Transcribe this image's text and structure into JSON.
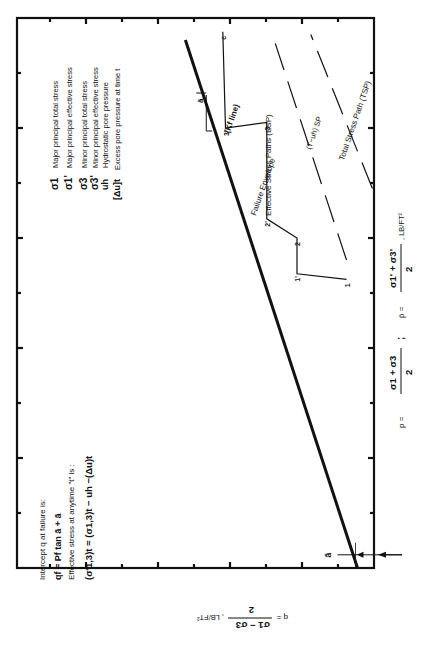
{
  "chart_data": {
    "type": "line",
    "orientation": "rotated 90° clockwise (p axis runs along page height, q axis along page width)",
    "xlabel": "p = (σ1 + σ3)/2 ;  p̄ = (σ1' + σ3')/2 , LB/FT²",
    "ylabel": "q = (σ1 − σ3)/2 , LB/FT²",
    "x_unit": "LB/FT²",
    "y_unit": "LB/FT²",
    "xlim": [
      0,
      100
    ],
    "ylim": [
      0,
      65
    ],
    "grid": false,
    "x_ticks": [
      10,
      20,
      30,
      40,
      50,
      60,
      70,
      80,
      90,
      100
    ],
    "y_ticks": [
      10,
      20,
      30,
      40,
      50,
      60
    ],
    "x_tick_labels": [],
    "y_tick_labels": [],
    "series": [
      {
        "name": "Failure Envelope (Kf line)",
        "style": "thick-solid",
        "points": [
          [
            0,
            3
          ],
          [
            96,
            34.3
          ]
        ]
      },
      {
        "name": "Effective Stress Paths (ESP)",
        "style": "thin-solid",
        "points": [
          [
            52.5,
            5
          ],
          [
            53.5,
            14
          ],
          [
            60,
            14
          ],
          [
            63.5,
            19.5
          ],
          [
            81,
            19.5
          ],
          [
            80,
            27
          ],
          [
            97.5,
            27.5
          ]
        ],
        "point_labels": [
          {
            "label": "1",
            "at": [
              52.5,
              5
            ]
          },
          {
            "label": "1'",
            "at": [
              53.5,
              14
            ]
          },
          {
            "label": "2",
            "at": [
              60,
              14
            ]
          },
          {
            "label": "2'",
            "at": [
              63.5,
              19.5
            ]
          },
          {
            "label": "3",
            "at": [
              81,
              19.5
            ]
          },
          {
            "label": "3'",
            "at": [
              80,
              27
            ]
          },
          {
            "label": "c",
            "at": [
              97.5,
              27.5
            ]
          }
        ]
      },
      {
        "name": "(T−uh) SP",
        "style": "dashed",
        "points": [
          [
            56,
            5
          ],
          [
            97,
            18.5
          ]
        ]
      },
      {
        "name": "Total Stress Path (TSP)",
        "style": "dashed",
        "points": [
          [
            69,
            0.3
          ],
          [
            97,
            11.5
          ]
        ]
      }
    ],
    "annotations": {
      "intercept_symbol": "ā",
      "slope_symbol": "ā",
      "kf_label": "Failure Envelope",
      "kf_sub": "(Kf line)",
      "esp_label": "Effective Stress Paths (ESP)",
      "tuh_label": "(T−uh) SP",
      "tsp_label": "Total Stress Path (TSP)"
    }
  },
  "legend": {
    "items": [
      {
        "symbol": "σ1",
        "text": "Major principal total stress"
      },
      {
        "symbol": "σ1'",
        "text": "Major principal effective stress"
      },
      {
        "symbol": "σ3",
        "text": "Minor principal total stress"
      },
      {
        "symbol": "σ3'",
        "text": "Minor principal effective stress"
      },
      {
        "symbol": "uh",
        "text": "Hydrostatic pore pressure"
      },
      {
        "symbol": "[Δu]t",
        "text": "Excess pore pressure at time t"
      }
    ]
  },
  "notes": {
    "line1": "Intercept q at failure is:",
    "line2": "qf = Pf tan ā + ā",
    "line3": "Effective stress at anytime \"t\" is :",
    "line4": "(σ'1,3)t = (σ1,3)t − uh −(Δu)t"
  },
  "axes": {
    "p_label_a": "p = ",
    "p_frac_a_num": "σ1 + σ3",
    "p_frac_a_den": "2",
    "p_sep": ";",
    "p_label_b": "p̄ =",
    "p_frac_b_num": "σ1' + σ3'",
    "p_frac_b_den": "2",
    "p_units": ", LB/FT²",
    "q_label": "q =",
    "q_frac_num": "σ1 − σ3",
    "q_frac_den": "2",
    "q_units": ", LB/FT²"
  }
}
